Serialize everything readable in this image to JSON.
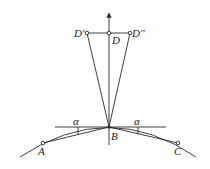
{
  "diagram": {
    "title": "",
    "points": {
      "D_prime": {
        "label": "D'",
        "x": 87,
        "y": 33
      },
      "D": {
        "label": "D",
        "x": 109,
        "y": 33
      },
      "D_double_prime": {
        "label": "D''",
        "x": 130,
        "y": 33
      },
      "B": {
        "label": "B",
        "x": 109,
        "y": 127
      },
      "A": {
        "label": "A",
        "x": 43,
        "y": 143
      },
      "C": {
        "label": "C",
        "x": 178,
        "y": 143
      }
    },
    "angles": {
      "left": {
        "label": "α"
      },
      "right": {
        "label": "α"
      }
    },
    "labels": {
      "d_prime": "D'",
      "d": "D",
      "d_double_prime": "D''",
      "b": "B",
      "a": "A",
      "c": "C",
      "alpha_left": "α",
      "alpha_right": "α"
    },
    "colors": {
      "stroke": "#2a2a2a",
      "background": "#ffffff"
    }
  }
}
